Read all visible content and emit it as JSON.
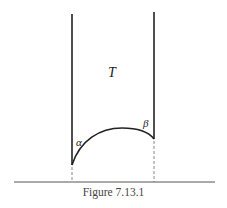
{
  "figure": {
    "caption": "Figure 7.13.1",
    "region_label": "T",
    "angle_left": "α",
    "angle_right": "β",
    "stroke_color": "#222222",
    "dash_color": "#888888"
  }
}
